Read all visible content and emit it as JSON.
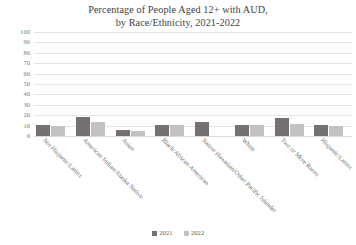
{
  "chart_data": {
    "type": "bar",
    "title": "Percentage of People Aged 12+ with AUD, by Race/Ethnicity, 2021-2022",
    "title_lines": [
      "Percentage of People Aged 12+ with AUD,",
      "by Race/Ethnicity, 2021-2022"
    ],
    "xlabel": "",
    "ylabel": "",
    "ylim": [
      0,
      100
    ],
    "yticks": [
      100,
      90,
      80,
      70,
      60,
      50,
      40,
      30,
      20,
      10,
      0
    ],
    "grid": true,
    "legend_position": "bottom",
    "categories": [
      "Not Hispanic/Latinx",
      "American Indian/Alaska Native",
      "Asian",
      "Black/African American",
      "Native Hawaiian/Other Pacific Islander",
      "White",
      "Two or More Races",
      "Hispanic/Latinx"
    ],
    "series": [
      {
        "name": "2021",
        "color": "#767171",
        "values": [
          11,
          18,
          6,
          11,
          13,
          11,
          17,
          11
        ]
      },
      {
        "name": "2022",
        "color": "#c2c2c2",
        "values": [
          10,
          13,
          5,
          11,
          0,
          11,
          12,
          10
        ]
      }
    ]
  },
  "legend": {
    "items": [
      {
        "label": "2021",
        "color": "#767171"
      },
      {
        "label": "2022",
        "color": "#c2c2c2"
      }
    ]
  }
}
